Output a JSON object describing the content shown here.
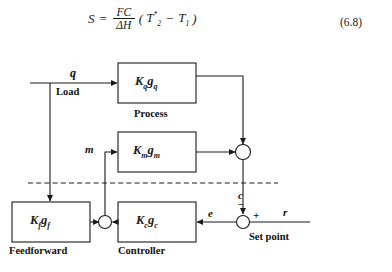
{
  "equation": {
    "lhs": "S",
    "equals": "=",
    "numerator": "FC",
    "denominator": "ΔH",
    "rhs_open": "(",
    "rhs_term1_base": "T",
    "rhs_term1_sub": "2",
    "rhs_term1_sup": "*",
    "rhs_minus": "−",
    "rhs_term2_base": "T",
    "rhs_term2_sub": "1",
    "rhs_close": ")",
    "number": "(6.8)"
  },
  "diagram": {
    "blocks": [
      {
        "id": "process",
        "gain": "K",
        "gain_sub": "q",
        "dyn": "g",
        "dyn_sub": "q",
        "caption": "Process"
      },
      {
        "id": "measurement",
        "gain": "K",
        "gain_sub": "m",
        "dyn": "g",
        "dyn_sub": "m",
        "caption": ""
      },
      {
        "id": "feedforward",
        "gain": "K",
        "gain_sub": "f",
        "dyn": "g",
        "dyn_sub": "f",
        "caption": "Feedforward"
      },
      {
        "id": "controller",
        "gain": "K",
        "gain_sub": "c",
        "dyn": "g",
        "dyn_sub": "c",
        "caption": "Controller"
      }
    ],
    "signals": {
      "load_var": "q",
      "load_caption": "Load",
      "manipulated_var": "m",
      "controlled_var": "c",
      "error_var": "e",
      "reference_var": "r",
      "setpoint_caption": "Set point",
      "plus_sign": "+",
      "minus_sign": "−"
    },
    "colors": {
      "line": "#1a1a1a",
      "background": "#ffffff"
    }
  }
}
